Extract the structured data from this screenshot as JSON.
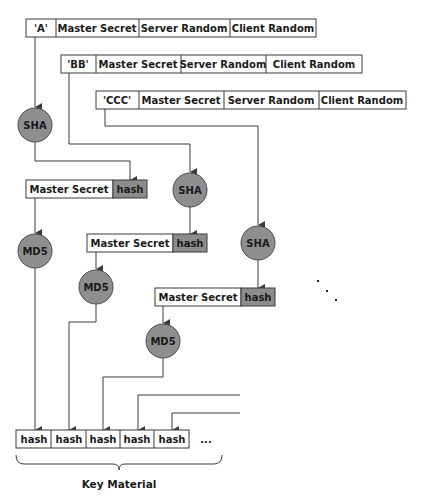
{
  "colors": {
    "stroke": "#3a3a3a",
    "hash_fill": "#8c8c8c",
    "node_fill": "#8e8e8e",
    "node_stroke": "#4a4a4a",
    "text": "#1a1a1a"
  },
  "input_rows": [
    {
      "label": "'A'",
      "master": "Master Secret",
      "server": "Server Random",
      "client": "Client Random"
    },
    {
      "label": "'BB'",
      "master": "Master Secret",
      "server": "Server Random",
      "client": "Client Random"
    },
    {
      "label": "'CCC'",
      "master": "Master Secret",
      "server": "Server Random",
      "client": "Client Random"
    }
  ],
  "sha_nodes": [
    "SHA",
    "SHA",
    "SHA"
  ],
  "md5_nodes": [
    "MD5",
    "MD5",
    "MD5"
  ],
  "md5_inputs": [
    {
      "master": "Master Secret",
      "hash": "hash"
    },
    {
      "master": "Master Secret",
      "hash": "hash"
    },
    {
      "master": "Master Secret",
      "hash": "hash"
    }
  ],
  "output": {
    "cells": [
      "hash",
      "hash",
      "hash",
      "hash",
      "hash"
    ],
    "ellipsis": "...",
    "continuation": ". . .",
    "label": "Key Material"
  }
}
